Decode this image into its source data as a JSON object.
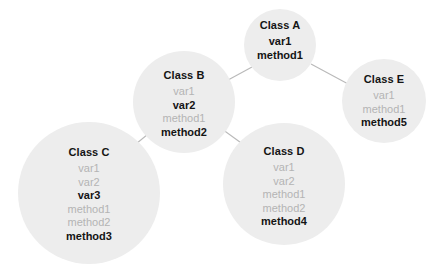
{
  "diagram": {
    "type": "inheritance-tree",
    "background_color": "#ffffff",
    "node_fill_color": "#ededed",
    "edge_color": "#b9b9b9",
    "inherited_text_color": "#b4b4b4",
    "own_text_color": "#141414",
    "nodes": [
      {
        "id": "A",
        "label": "Class A",
        "cx": 280,
        "cy": 45,
        "r": 36,
        "title_offset": 10,
        "members": [
          {
            "name": "var1",
            "kind": "own"
          },
          {
            "name": "method1",
            "kind": "own"
          }
        ]
      },
      {
        "id": "B",
        "label": "Class B",
        "cx": 184,
        "cy": 102,
        "r": 51,
        "title_offset": 18,
        "members": [
          {
            "name": "var1",
            "kind": "inherited"
          },
          {
            "name": "var2",
            "kind": "own"
          },
          {
            "name": "method1",
            "kind": "inherited"
          },
          {
            "name": "method2",
            "kind": "own"
          }
        ]
      },
      {
        "id": "C",
        "label": "Class C",
        "cx": 89,
        "cy": 193,
        "r": 71,
        "title_offset": 24,
        "members": [
          {
            "name": "var1",
            "kind": "inherited"
          },
          {
            "name": "var2",
            "kind": "inherited"
          },
          {
            "name": "var3",
            "kind": "own"
          },
          {
            "name": "method1",
            "kind": "inherited"
          },
          {
            "name": "method2",
            "kind": "inherited"
          },
          {
            "name": "method3",
            "kind": "own"
          }
        ]
      },
      {
        "id": "D",
        "label": "Class D",
        "cx": 284,
        "cy": 184,
        "r": 61,
        "title_offset": 22,
        "members": [
          {
            "name": "var1",
            "kind": "inherited"
          },
          {
            "name": "var2",
            "kind": "inherited"
          },
          {
            "name": "method1",
            "kind": "inherited"
          },
          {
            "name": "method2",
            "kind": "inherited"
          },
          {
            "name": "method4",
            "kind": "own"
          }
        ]
      },
      {
        "id": "E",
        "label": "Class E",
        "cx": 384,
        "cy": 101,
        "r": 42,
        "title_offset": 14,
        "members": [
          {
            "name": "var1",
            "kind": "inherited"
          },
          {
            "name": "method1",
            "kind": "inherited"
          },
          {
            "name": "method5",
            "kind": "own"
          }
        ]
      }
    ],
    "edges": [
      {
        "from": "A",
        "to": "B",
        "x1": 252,
        "y1": 67,
        "x2": 217,
        "y2": 86
      },
      {
        "from": "A",
        "to": "E",
        "x1": 311,
        "y1": 64,
        "x2": 350,
        "y2": 85
      },
      {
        "from": "B",
        "to": "C",
        "x1": 153,
        "y1": 130,
        "x2": 131,
        "y2": 148
      },
      {
        "from": "B",
        "to": "D",
        "x1": 215,
        "y1": 124,
        "x2": 244,
        "y2": 145
      }
    ]
  }
}
